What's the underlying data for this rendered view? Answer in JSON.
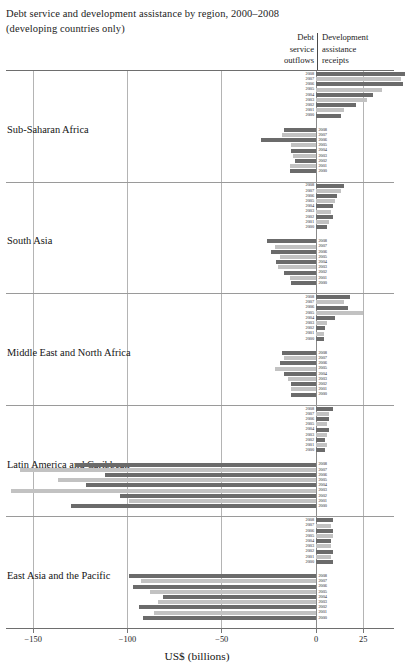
{
  "title": {
    "line1": "Debt service and development assistance by region, 2000–2008",
    "line2": "(developing countries only)"
  },
  "column_headers": {
    "debt": {
      "l1": "Debt",
      "l2": "service",
      "l3": "outflows"
    },
    "aid": {
      "l1": "Development",
      "l2": "assistance",
      "l3": "receipts"
    }
  },
  "axis": {
    "title": "US$ (billions)",
    "ticks": [
      {
        "value": -150,
        "label": "−150"
      },
      {
        "value": -100,
        "label": "−100"
      },
      {
        "value": -50,
        "label": "−50"
      },
      {
        "value": 0,
        "label": "0"
      },
      {
        "value": 25,
        "label": "25"
      }
    ]
  },
  "colors": {
    "bar_dark": "#6b6b6b",
    "bar_light": "#c2c2c2",
    "gridline": "#b4b4b4",
    "rule": "#6e6e6e",
    "text": "#1a1a1a"
  },
  "years": [
    "2008",
    "2007",
    "2006",
    "2005",
    "2004",
    "2003",
    "2002",
    "2001",
    "2000"
  ],
  "chart_data": {
    "type": "bar",
    "orientation": "horizontal",
    "title": "Debt service and development assistance by region, 2000–2008 (developing countries only)",
    "xlabel": "US$ (billions)",
    "ylabel": "",
    "xlim": [
      -170,
      32
    ],
    "grid": true,
    "legend_position": "none",
    "note": "Each region has two stacks of nine year-bars: development assistance receipts (positive, right of zero) and debt service outflows (negative, left of zero). Bars alternate dark/light shading by year.",
    "categories": [
      "2008",
      "2007",
      "2006",
      "2005",
      "2004",
      "2003",
      "2002",
      "2001",
      "2000"
    ],
    "regions": [
      {
        "name": "Sub-Saharan Africa",
        "series": [
          {
            "name": "Development assistance receipts",
            "values": [
              47,
              45,
              46,
              35,
              30,
              27,
              21,
              15,
              13
            ]
          },
          {
            "name": "Debt service outflows",
            "values": [
              -17,
              -18,
              -29,
              -13,
              -13,
              -12,
              -11,
              -14,
              -14
            ]
          }
        ]
      },
      {
        "name": "South Asia",
        "series": [
          {
            "name": "Development assistance receipts",
            "values": [
              15,
              13,
              11,
              10,
              9,
              8,
              9,
              7,
              6
            ]
          },
          {
            "name": "Debt service outflows",
            "values": [
              -26,
              -22,
              -24,
              -19,
              -21,
              -20,
              -17,
              -14,
              -13
            ]
          }
        ]
      },
      {
        "name": "Middle East and North Africa",
        "series": [
          {
            "name": "Development assistance receipts",
            "values": [
              18,
              15,
              17,
              25,
              10,
              6,
              5,
              4,
              4
            ]
          },
          {
            "name": "Debt service outflows",
            "values": [
              -18,
              -17,
              -19,
              -22,
              -17,
              -15,
              -13,
              -13,
              -13
            ]
          }
        ]
      },
      {
        "name": "Latin America and Caribbean",
        "series": [
          {
            "name": "Development assistance receipts",
            "values": [
              9,
              7,
              7,
              6,
              7,
              6,
              5,
              6,
              5
            ]
          },
          {
            "name": "Debt service outflows",
            "values": [
              -128,
              -157,
              -112,
              -137,
              -122,
              -162,
              -104,
              -99,
              -130
            ]
          }
        ]
      },
      {
        "name": "East Asia and the Pacific",
        "series": [
          {
            "name": "Development assistance receipts",
            "values": [
              9,
              8,
              9,
              9,
              8,
              8,
              9,
              8,
              9
            ]
          },
          {
            "name": "Debt service outflows",
            "values": [
              -99,
              -93,
              -97,
              -88,
              -81,
              -84,
              -94,
              -86,
              -92
            ]
          }
        ]
      }
    ]
  }
}
